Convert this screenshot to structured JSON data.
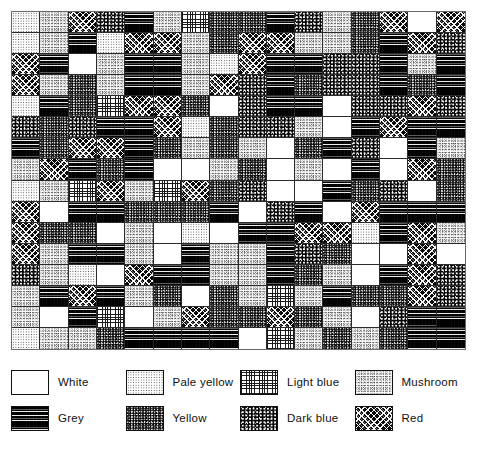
{
  "figure": {
    "type": "pattern-grid-with-key",
    "grid": {
      "rows": 16,
      "columns": 16,
      "cell_count": 256,
      "border_color": "#6a6a6a",
      "cell_line_color": "#2b2b2b"
    }
  },
  "legend": {
    "rows": [
      [
        {
          "key": "white",
          "label": "White",
          "pattern_class": "p-white"
        },
        {
          "key": "paleyellow",
          "label": "Pale yellow",
          "pattern_class": "p-paleyellow"
        },
        {
          "key": "lightblue",
          "label": "Light blue",
          "pattern_class": "p-lightblue"
        },
        {
          "key": "mushroom",
          "label": "Mushroom",
          "pattern_class": "p-mushroom"
        }
      ],
      [
        {
          "key": "grey",
          "label": "Grey",
          "pattern_class": "p-grey"
        },
        {
          "key": "yellow",
          "label": "Yellow",
          "pattern_class": "p-yellow"
        },
        {
          "key": "darkblue",
          "label": "Dark blue",
          "pattern_class": "p-darkblue"
        },
        {
          "key": "red",
          "label": "Red",
          "pattern_class": "p-red"
        }
      ]
    ]
  },
  "chart_data": {
    "type": "heatmap",
    "title": "",
    "xlabel": "",
    "ylabel": "",
    "grid": true,
    "legend_position": "bottom",
    "categories": [
      "White",
      "Pale yellow",
      "Light blue",
      "Mushroom",
      "Grey",
      "Yellow",
      "Dark blue",
      "Red"
    ],
    "category_keys": [
      "white",
      "paleyellow",
      "lightblue",
      "mushroom",
      "grey",
      "yellow",
      "darkblue",
      "red"
    ],
    "rows": 16,
    "columns": 16,
    "cells": [
      [
        "paleyellow",
        "mushroom",
        "red",
        "darkblue",
        "grey",
        "mushroom",
        "lightblue",
        "yellow",
        "yellow",
        "grey",
        "darkblue",
        "mushroom",
        "yellow",
        "red",
        "white",
        "red"
      ],
      [
        "paleyellow",
        "mushroom",
        "grey",
        "paleyellow",
        "red",
        "red",
        "mushroom",
        "yellow",
        "red",
        "red",
        "mushroom",
        "mushroom",
        "yellow",
        "grey",
        "red",
        "darkblue"
      ],
      [
        "red",
        "grey",
        "white",
        "mushroom",
        "grey",
        "grey",
        "mushroom",
        "paleyellow",
        "red",
        "grey",
        "grey",
        "darkblue",
        "darkblue",
        "grey",
        "mushroom",
        "grey"
      ],
      [
        "red",
        "mushroom",
        "yellow",
        "mushroom",
        "grey",
        "grey",
        "mushroom",
        "red",
        "darkblue",
        "grey",
        "yellow",
        "darkblue",
        "darkblue",
        "grey",
        "yellow",
        "grey"
      ],
      [
        "paleyellow",
        "grey",
        "yellow",
        "lightblue",
        "red",
        "red",
        "yellow",
        "white",
        "darkblue",
        "grey",
        "grey",
        "white",
        "darkblue",
        "darkblue",
        "red",
        "darkblue"
      ],
      [
        "darkblue",
        "yellow",
        "darkblue",
        "grey",
        "grey",
        "red",
        "paleyellow",
        "yellow",
        "darkblue",
        "darkblue",
        "mushroom",
        "white",
        "grey",
        "red",
        "grey",
        "grey"
      ],
      [
        "grey",
        "yellow",
        "red",
        "red",
        "grey",
        "yellow",
        "mushroom",
        "yellow",
        "mushroom",
        "white",
        "yellow",
        "grey",
        "darkblue",
        "white",
        "grey",
        "mushroom"
      ],
      [
        "mushroom",
        "red",
        "grey",
        "yellow",
        "grey",
        "white",
        "white",
        "mushroom",
        "yellow",
        "white",
        "mushroom",
        "white",
        "grey",
        "white",
        "red",
        "yellow"
      ],
      [
        "paleyellow",
        "mushroom",
        "lightblue",
        "red",
        "mushroom",
        "lightblue",
        "red",
        "yellow",
        "darkblue",
        "white",
        "white",
        "grey",
        "yellow",
        "darkblue",
        "white",
        "yellow"
      ],
      [
        "red",
        "white",
        "grey",
        "grey",
        "yellow",
        "yellow",
        "yellow",
        "grey",
        "white",
        "darkblue",
        "grey",
        "white",
        "red",
        "grey",
        "grey",
        "grey"
      ],
      [
        "red",
        "yellow",
        "yellow",
        "white",
        "mushroom",
        "white",
        "paleyellow",
        "white",
        "grey",
        "grey",
        "red",
        "red",
        "paleyellow",
        "grey",
        "red",
        "mushroom"
      ],
      [
        "red",
        "mushroom",
        "grey",
        "grey",
        "mushroom",
        "white",
        "grey",
        "mushroom",
        "mushroom",
        "grey",
        "darkblue",
        "yellow",
        "white",
        "white",
        "red",
        "white"
      ],
      [
        "darkblue",
        "mushroom",
        "paleyellow",
        "white",
        "red",
        "grey",
        "grey",
        "mushroom",
        "mushroom",
        "grey",
        "yellow",
        "mushroom",
        "white",
        "grey",
        "red",
        "darkblue"
      ],
      [
        "mushroom",
        "grey",
        "red",
        "grey",
        "mushroom",
        "yellow",
        "white",
        "yellow",
        "mushroom",
        "lightblue",
        "mushroom",
        "grey",
        "yellow",
        "yellow",
        "red",
        "darkblue"
      ],
      [
        "mushroom",
        "white",
        "grey",
        "lightblue",
        "white",
        "mushroom",
        "red",
        "yellow",
        "yellow",
        "red",
        "yellow",
        "mushroom",
        "white",
        "darkblue",
        "grey",
        "grey"
      ],
      [
        "paleyellow",
        "mushroom",
        "mushroom",
        "yellow",
        "grey",
        "grey",
        "grey",
        "grey",
        "white",
        "lightblue",
        "mushroom",
        "yellow",
        "mushroom",
        "yellow",
        "grey",
        "grey"
      ]
    ]
  }
}
